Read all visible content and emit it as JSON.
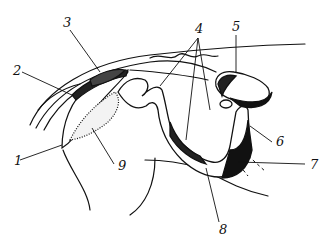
{
  "figure": {
    "type": "anatomical line drawing",
    "labels": [
      {
        "id": "1",
        "text": "1",
        "x": 14,
        "y": 165
      },
      {
        "id": "2",
        "text": "2",
        "x": 13,
        "y": 75
      },
      {
        "id": "3",
        "text": "3",
        "x": 63,
        "y": 27
      },
      {
        "id": "4",
        "text": "4",
        "x": 195,
        "y": 33
      },
      {
        "id": "5",
        "text": "5",
        "x": 232,
        "y": 31
      },
      {
        "id": "6",
        "text": "6",
        "x": 276,
        "y": 146
      },
      {
        "id": "7",
        "text": "7",
        "x": 310,
        "y": 169
      },
      {
        "id": "8",
        "text": "8",
        "x": 219,
        "y": 234
      },
      {
        "id": "9",
        "text": "9",
        "x": 118,
        "y": 170
      }
    ],
    "colors": {
      "ink": "#111111",
      "paper": "#ffffff"
    }
  }
}
